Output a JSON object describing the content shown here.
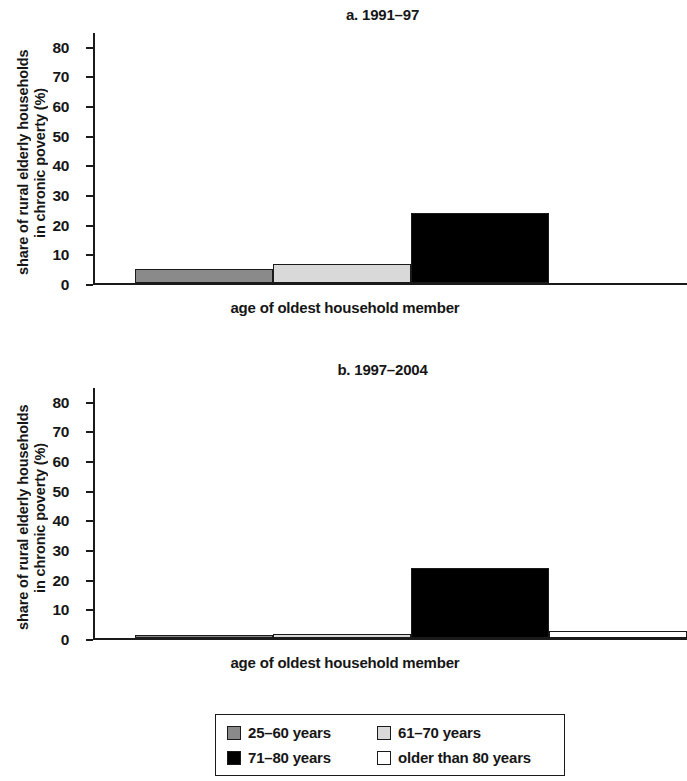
{
  "figure": {
    "panels": [
      {
        "id": "a",
        "title": "a. 1991–97",
        "ylabel_line1": "share of rural elderly households",
        "ylabel_line2": "in chronic poverty (%)",
        "xlabel": "age of oldest household member"
      },
      {
        "id": "b",
        "title": "b. 1997–2004",
        "ylabel_line1": "share of rural elderly households",
        "ylabel_line2": "in chronic poverty (%)",
        "xlabel": "age of oldest household member"
      }
    ],
    "legend": {
      "items": [
        {
          "label": "25–60 years",
          "color": "#8a8a8a"
        },
        {
          "label": "61–70 years",
          "color": "#d9d9d9"
        },
        {
          "label": "71–80 years",
          "color": "#000000"
        },
        {
          "label": "older than 80 years",
          "color": "#ffffff"
        }
      ]
    },
    "axis_ticks": [
      "0",
      "10",
      "20",
      "30",
      "40",
      "50",
      "60",
      "70",
      "80"
    ]
  },
  "chart_data": [
    {
      "type": "bar",
      "title": "a. 1991–97",
      "xlabel": "age of oldest household member",
      "ylabel": "share of rural elderly households in chronic poverty (%)",
      "categories": [
        "25–60 years",
        "61–70 years",
        "71–80 years",
        "older than 80 years"
      ],
      "values": [
        4.8,
        6.3,
        23.5,
        0
      ],
      "colors": [
        "#8a8a8a",
        "#d9d9d9",
        "#000000",
        "#ffffff"
      ],
      "ylim": [
        0,
        85
      ],
      "yticks": [
        0,
        10,
        20,
        30,
        40,
        50,
        60,
        70,
        80
      ],
      "grid": false,
      "legend_position": "bottom"
    },
    {
      "type": "bar",
      "title": "b. 1997–2004",
      "xlabel": "age of oldest household member",
      "ylabel": "share of rural elderly households in chronic poverty (%)",
      "categories": [
        "25–60 years",
        "61–70 years",
        "71–80 years",
        "older than 80 years"
      ],
      "values": [
        0.8,
        1.2,
        23.5,
        2.3
      ],
      "colors": [
        "#8a8a8a",
        "#d9d9d9",
        "#000000",
        "#ffffff"
      ],
      "ylim": [
        0,
        85
      ],
      "yticks": [
        0,
        10,
        20,
        30,
        40,
        50,
        60,
        70,
        80
      ],
      "grid": false,
      "legend_position": "bottom"
    }
  ]
}
